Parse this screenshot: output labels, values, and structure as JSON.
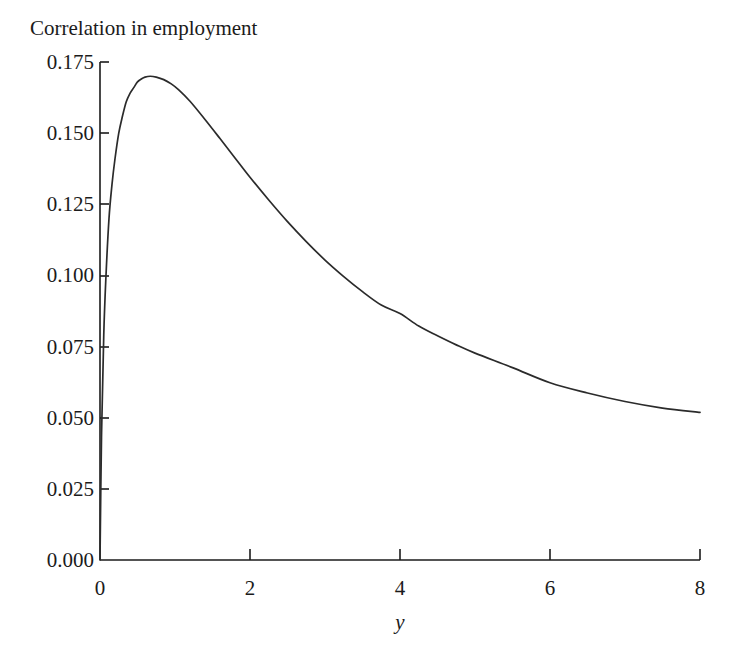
{
  "figure": {
    "title": "Correlation in employment",
    "background_color": "#ffffff",
    "line_color": "#2b2b2b",
    "axis_color": "#1b1b1b"
  },
  "axes": {
    "y_title": "Correlation in employment",
    "x_title": "y",
    "y_ticks": [
      "0.000",
      "0.025",
      "0.050",
      "0.075",
      "0.100",
      "0.125",
      "0.150",
      "0.175"
    ],
    "x_ticks": [
      "0",
      "2",
      "4",
      "6",
      "8"
    ]
  },
  "chart_data": {
    "type": "line",
    "title": "Correlation in employment",
    "subtitle": "",
    "xlabel": "y",
    "ylabel": "Correlation in employment",
    "xlim": [
      0,
      8
    ],
    "ylim": [
      0,
      0.175
    ],
    "grid": false,
    "legend": null,
    "legend_position": "none",
    "x_tick_values": [
      0,
      2,
      4,
      6,
      8
    ],
    "y_tick_values": [
      0.0,
      0.025,
      0.05,
      0.075,
      0.1,
      0.125,
      0.15,
      0.175
    ],
    "annotations": [],
    "series": [
      {
        "name": "Correlation in employment",
        "color": "#2b2b2b",
        "x": [
          0.0,
          0.02,
          0.05,
          0.08,
          0.12,
          0.16,
          0.2,
          0.25,
          0.3,
          0.35,
          0.4,
          0.45,
          0.5,
          0.55,
          0.6,
          0.67,
          0.75,
          0.85,
          0.95,
          1.05,
          1.2,
          1.4,
          1.6,
          1.8,
          2.0,
          2.25,
          2.5,
          2.75,
          3.0,
          3.25,
          3.5,
          3.75,
          4.0,
          4.25,
          4.5,
          4.75,
          5.0,
          5.5,
          6.0,
          6.5,
          7.0,
          7.5,
          8.0
        ],
        "y": [
          0.0,
          0.043,
          0.079,
          0.1,
          0.12,
          0.132,
          0.141,
          0.15,
          0.156,
          0.161,
          0.164,
          0.166,
          0.168,
          0.169,
          0.1697,
          0.17,
          0.1697,
          0.1688,
          0.1673,
          0.1652,
          0.1612,
          0.1548,
          0.1481,
          0.1413,
          0.1345,
          0.1265,
          0.1189,
          0.1119,
          0.1054,
          0.0996,
          0.0943,
          0.0896,
          0.0866,
          0.0822,
          0.0788,
          0.0756,
          0.0727,
          0.0676,
          0.0623,
          0.0587,
          0.0557,
          0.0534,
          0.0519
        ]
      }
    ],
    "peak": {
      "x": 0.67,
      "y": 0.17
    },
    "endpoint": {
      "x": 8.0,
      "y": 0.052
    }
  }
}
